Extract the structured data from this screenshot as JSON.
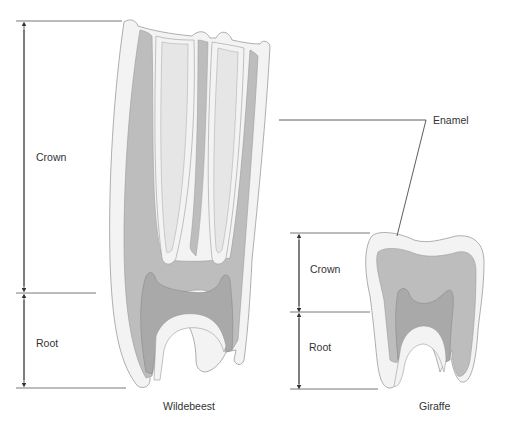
{
  "diagram": {
    "colors": {
      "enamel": "#f3f3f3",
      "enamel_outline": "#9a9a9a",
      "dentine": "#bdbdbd",
      "pulp": "#a9a9a9",
      "infundibulum": "#e6e6e6",
      "line": "#333333"
    },
    "wildebeest": {
      "name": "Wildebeest",
      "crown_label": "Crown",
      "root_label": "Root"
    },
    "giraffe": {
      "name": "Giraffe",
      "crown_label": "Crown",
      "root_label": "Root"
    },
    "callout": {
      "label": "Enamel"
    }
  }
}
